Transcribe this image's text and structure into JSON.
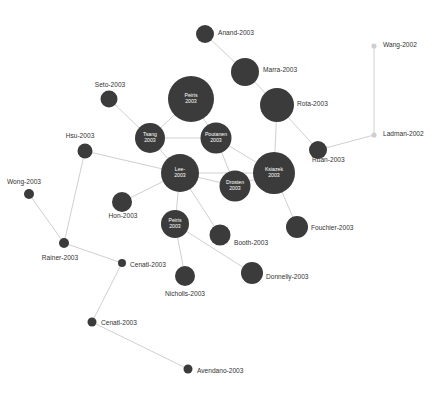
{
  "chart_data": {
    "type": "scatter",
    "title": "",
    "subtitle": "",
    "xlabel": "",
    "ylabel": "",
    "grid": false,
    "legend": null,
    "layout": "force-directed-network",
    "background_color": "#ffffff",
    "node_color": "#3b3b3b",
    "node_color_faint": "#cfcfcf",
    "edge_color": "#d0d0d0",
    "label_color": "#333333",
    "inner_label_color": "#ffffff",
    "xlim": [
      0,
      447
    ],
    "ylim": [
      0,
      394
    ],
    "nodes": [
      {
        "id": "anand",
        "label": "Anand-2003",
        "x": 205,
        "y": 34,
        "r": 9,
        "label_mode": "outside",
        "label_x": 218,
        "label_y": 33,
        "anchor": "start",
        "faint": false
      },
      {
        "id": "marra",
        "label": "Marra-2003",
        "x": 245,
        "y": 72,
        "r": 14,
        "label_mode": "outside",
        "label_x": 263,
        "label_y": 70,
        "anchor": "start",
        "faint": false
      },
      {
        "id": "wang",
        "label": "Wang-2002",
        "x": 374,
        "y": 46,
        "r": 2.6,
        "label_mode": "outside",
        "label_x": 383,
        "label_y": 45,
        "anchor": "start",
        "faint": true
      },
      {
        "id": "ladman",
        "label": "Ladman-2002",
        "x": 374,
        "y": 135,
        "r": 2.6,
        "label_mode": "outside",
        "label_x": 383,
        "label_y": 134,
        "anchor": "start",
        "faint": true
      },
      {
        "id": "seto",
        "label": "Seto-2003",
        "x": 109,
        "y": 99,
        "r": 8.5,
        "label_mode": "outside",
        "label_x": 110,
        "label_y": 85,
        "anchor": "middle",
        "faint": false
      },
      {
        "id": "peiris_top",
        "label": "Peiris 2003",
        "x": 191,
        "y": 99,
        "r": 23,
        "label_mode": "inside",
        "faint": false
      },
      {
        "id": "rota",
        "label": "Rota-2003",
        "x": 277,
        "y": 105,
        "r": 17,
        "label_mode": "outside",
        "label_x": 297,
        "label_y": 104,
        "anchor": "start",
        "faint": false
      },
      {
        "id": "hsu",
        "label": "Hsu-2003",
        "x": 85,
        "y": 151,
        "r": 7.5,
        "label_mode": "outside",
        "label_x": 80,
        "label_y": 136,
        "anchor": "middle",
        "faint": false
      },
      {
        "id": "tsang",
        "label": "Tsang 2003",
        "x": 150,
        "y": 138,
        "r": 15,
        "label_mode": "inside",
        "faint": false
      },
      {
        "id": "poutanen",
        "label": "Poutanen 2003",
        "x": 216,
        "y": 138,
        "r": 15.5,
        "label_mode": "inside",
        "faint": false
      },
      {
        "id": "ruan",
        "label": "Ruan-2003",
        "x": 318,
        "y": 150,
        "r": 9,
        "label_mode": "outside",
        "label_x": 312,
        "label_y": 160,
        "anchor": "start",
        "faint": false
      },
      {
        "id": "lee",
        "label": "Lee- 2003",
        "x": 180,
        "y": 173,
        "r": 19,
        "label_mode": "inside",
        "faint": false
      },
      {
        "id": "ksiazek",
        "label": "Ksiazek 2003",
        "x": 274,
        "y": 173,
        "r": 21,
        "label_mode": "inside",
        "faint": false
      },
      {
        "id": "drosten",
        "label": "Drosten 2003",
        "x": 235,
        "y": 186,
        "r": 15.5,
        "label_mode": "inside",
        "faint": false
      },
      {
        "id": "wong",
        "label": "Wong-2003",
        "x": 29,
        "y": 194,
        "r": 5,
        "label_mode": "outside",
        "label_x": 24,
        "label_y": 182,
        "anchor": "middle",
        "faint": false
      },
      {
        "id": "hon",
        "label": "Hon-2003",
        "x": 122,
        "y": 202,
        "r": 10,
        "label_mode": "outside",
        "label_x": 123,
        "label_y": 216,
        "anchor": "middle",
        "faint": false
      },
      {
        "id": "peiris_bot",
        "label": "Peiris 2003",
        "x": 175,
        "y": 224,
        "r": 14,
        "label_mode": "inside",
        "faint": false
      },
      {
        "id": "fouchier",
        "label": "Fouchier-2003",
        "x": 297,
        "y": 227,
        "r": 11,
        "label_mode": "outside",
        "label_x": 311,
        "label_y": 228,
        "anchor": "start",
        "faint": false
      },
      {
        "id": "booth",
        "label": "Booth-2003",
        "x": 220,
        "y": 235,
        "r": 10.5,
        "label_mode": "outside",
        "label_x": 234,
        "label_y": 243,
        "anchor": "start",
        "faint": false
      },
      {
        "id": "rainer",
        "label": "Rainer-2003",
        "x": 64,
        "y": 243,
        "r": 5,
        "label_mode": "outside",
        "label_x": 60,
        "label_y": 258,
        "anchor": "middle",
        "faint": false
      },
      {
        "id": "cenatl_1",
        "label": "Cenatl-2003",
        "x": 122,
        "y": 263,
        "r": 4,
        "label_mode": "outside",
        "label_x": 130,
        "label_y": 265,
        "anchor": "start",
        "faint": false
      },
      {
        "id": "donnelly",
        "label": "Donnelly-2003",
        "x": 252,
        "y": 273,
        "r": 11,
        "label_mode": "outside",
        "label_x": 266,
        "label_y": 277,
        "anchor": "start",
        "faint": false
      },
      {
        "id": "nicholls",
        "label": "Nicholls-2003",
        "x": 185,
        "y": 276,
        "r": 10,
        "label_mode": "outside",
        "label_x": 185,
        "label_y": 294,
        "anchor": "middle",
        "faint": false
      },
      {
        "id": "cenatl_2",
        "label": "Cenatl-2003",
        "x": 92,
        "y": 322,
        "r": 4.5,
        "label_mode": "outside",
        "label_x": 101,
        "label_y": 323,
        "anchor": "start",
        "faint": false
      },
      {
        "id": "avendano",
        "label": "Avendano-2003",
        "x": 188,
        "y": 369,
        "r": 4.5,
        "label_mode": "outside",
        "label_x": 197,
        "label_y": 371,
        "anchor": "start",
        "faint": false
      }
    ],
    "edges": [
      {
        "source": "anand",
        "target": "marra"
      },
      {
        "source": "marra",
        "target": "rota"
      },
      {
        "source": "wang",
        "target": "ladman"
      },
      {
        "source": "ladman",
        "target": "ruan"
      },
      {
        "source": "rota",
        "target": "ruan"
      },
      {
        "source": "rota",
        "target": "ksiazek"
      },
      {
        "source": "seto",
        "target": "tsang"
      },
      {
        "source": "peiris_top",
        "target": "tsang"
      },
      {
        "source": "peiris_top",
        "target": "poutanen"
      },
      {
        "source": "tsang",
        "target": "poutanen"
      },
      {
        "source": "tsang",
        "target": "lee"
      },
      {
        "source": "poutanen",
        "target": "ksiazek"
      },
      {
        "source": "poutanen",
        "target": "drosten"
      },
      {
        "source": "hsu",
        "target": "lee"
      },
      {
        "source": "hsu",
        "target": "rainer"
      },
      {
        "source": "lee",
        "target": "hon"
      },
      {
        "source": "lee",
        "target": "drosten"
      },
      {
        "source": "lee",
        "target": "peiris_bot"
      },
      {
        "source": "lee",
        "target": "booth"
      },
      {
        "source": "lee",
        "target": "ksiazek"
      },
      {
        "source": "ksiazek",
        "target": "drosten"
      },
      {
        "source": "ksiazek",
        "target": "fouchier"
      },
      {
        "source": "wong",
        "target": "rainer"
      },
      {
        "source": "rainer",
        "target": "cenatl_1"
      },
      {
        "source": "peiris_bot",
        "target": "nicholls"
      },
      {
        "source": "peiris_bot",
        "target": "donnelly"
      },
      {
        "source": "cenatl_1",
        "target": "cenatl_2"
      },
      {
        "source": "cenatl_2",
        "target": "avendano"
      }
    ]
  }
}
